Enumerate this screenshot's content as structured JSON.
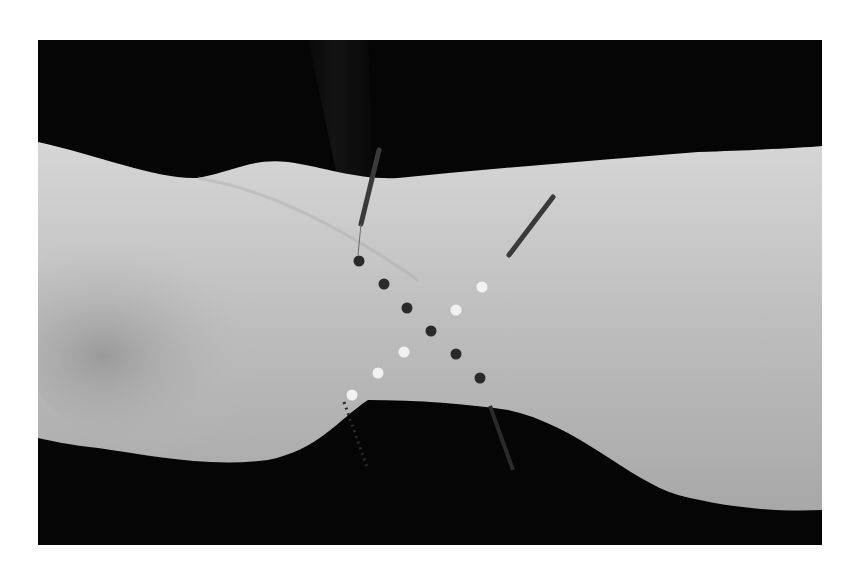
{
  "figure": {
    "background_color": "#050505",
    "skin_color": "#c8c8c8",
    "markers": {
      "dark_dots": [
        {
          "x": 321,
          "y": 221
        },
        {
          "x": 346,
          "y": 244
        },
        {
          "x": 369,
          "y": 268
        },
        {
          "x": 393,
          "y": 291
        },
        {
          "x": 418,
          "y": 314
        },
        {
          "x": 442,
          "y": 338
        }
      ],
      "light_dots": [
        {
          "x": 444,
          "y": 247
        },
        {
          "x": 418,
          "y": 270
        },
        {
          "x": 366,
          "y": 312
        },
        {
          "x": 340,
          "y": 333
        },
        {
          "x": 314,
          "y": 355
        }
      ],
      "dark_color": "#2a2a2a",
      "light_color": "#f2f2f2"
    },
    "needles": [
      {
        "x1": 341,
        "y1": 110,
        "x2": 323,
        "y2": 184
      },
      {
        "x1": 515,
        "y1": 157,
        "x2": 471,
        "y2": 215
      },
      {
        "x1": 306,
        "y1": 362,
        "x2": 330,
        "y2": 430
      },
      {
        "x1": 452,
        "y1": 366,
        "x2": 475,
        "y2": 430
      }
    ]
  }
}
